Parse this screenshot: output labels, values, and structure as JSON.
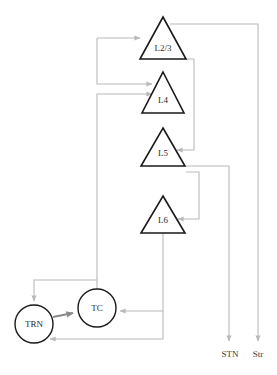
{
  "diagram": {
    "background_color": "#ffffff",
    "node_stroke_color": "#1a1a1a",
    "connection_color": "#b9b9b9",
    "connection_strong_color": "#8a8a8a",
    "label_color": "#2b2b2b"
  },
  "cortical_layers": [
    {
      "id": "l23",
      "label": "L2/3",
      "shape": "triangle",
      "cx": 163,
      "apex_y": 17,
      "base_y": 59,
      "half_width": 23
    },
    {
      "id": "l4",
      "label": "L4",
      "shape": "triangle",
      "cx": 163,
      "apex_y": 72,
      "base_y": 113,
      "half_width": 21
    },
    {
      "id": "l5",
      "label": "L5",
      "shape": "triangle",
      "cx": 163,
      "apex_y": 128,
      "base_y": 166,
      "half_width": 22
    },
    {
      "id": "l6",
      "label": "L6",
      "shape": "triangle",
      "cx": 163,
      "apex_y": 196,
      "base_y": 233,
      "half_width": 22
    }
  ],
  "thalamic_nuclei": [
    {
      "id": "trn",
      "label": "TRN",
      "shape": "circle",
      "cx": 34,
      "cy": 324,
      "r": 19
    },
    {
      "id": "tc",
      "label": "TC",
      "shape": "circle",
      "cx": 97,
      "cy": 308,
      "r": 19
    }
  ],
  "outputs": [
    {
      "id": "stn",
      "label": "STN",
      "x": 230,
      "label_y": 356,
      "arrow_y": 344
    },
    {
      "id": "str",
      "label": "Str",
      "x": 258,
      "label_y": 356,
      "arrow_y": 344
    }
  ],
  "connections": [
    {
      "id": "l23-to-str",
      "from": "L2/3",
      "to": "Str",
      "style": "thin"
    },
    {
      "id": "l23-to-l4",
      "from": "L2/3",
      "to": "L4",
      "style": "thin"
    },
    {
      "id": "l23-to-l5",
      "from": "L2/3",
      "to": "L5",
      "style": "thin"
    },
    {
      "id": "l5-to-stn",
      "from": "L5",
      "to": "STN",
      "style": "thin"
    },
    {
      "id": "l5-to-l6",
      "from": "L5",
      "to": "L6",
      "style": "thin"
    },
    {
      "id": "l6-to-tc",
      "from": "L6",
      "to": "TC",
      "style": "thin"
    },
    {
      "id": "l6-to-trn",
      "from": "L6",
      "to": "TRN",
      "style": "thin"
    },
    {
      "id": "tc-to-l4",
      "from": "TC",
      "to": "L4",
      "style": "thin"
    },
    {
      "id": "tc-to-trn",
      "from": "TC",
      "to": "TRN",
      "style": "thin"
    },
    {
      "id": "trn-to-tc",
      "from": "TRN",
      "to": "TC",
      "style": "thick"
    }
  ]
}
